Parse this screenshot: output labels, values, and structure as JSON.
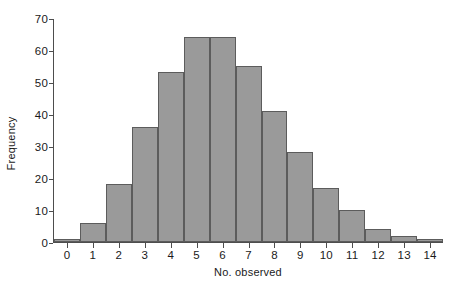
{
  "chart_data": {
    "type": "bar",
    "title": "",
    "subtitle": "",
    "xlabel": "No. observed",
    "ylabel": "Frequency",
    "categories": [
      "0",
      "1",
      "2",
      "3",
      "4",
      "5",
      "6",
      "7",
      "8",
      "9",
      "10",
      "11",
      "12",
      "13",
      "14"
    ],
    "values": [
      1,
      6,
      18,
      36,
      53,
      64,
      64,
      55,
      41,
      28,
      17,
      10,
      4,
      2,
      1
    ],
    "xlim": [
      -0.5,
      14.5
    ],
    "ylim": [
      0,
      70
    ],
    "ytick_labels": [
      "0",
      "10",
      "20",
      "30",
      "40",
      "50",
      "60",
      "70"
    ],
    "ytick_values": [
      0,
      10,
      20,
      30,
      40,
      50,
      60,
      70
    ],
    "xtick_labels": [
      "0",
      "1",
      "2",
      "3",
      "4",
      "5",
      "6",
      "7",
      "8",
      "9",
      "10",
      "11",
      "12",
      "13",
      "14"
    ],
    "grid": false,
    "legend": false,
    "legend_position": "none",
    "bar_fill_color": "#9a9a9a",
    "bar_edge_color": "#5c5c5c",
    "axis_color": "#4d4d4d",
    "background_color": "#ffffff",
    "text_color": "#1a1a1a",
    "annotations": []
  }
}
